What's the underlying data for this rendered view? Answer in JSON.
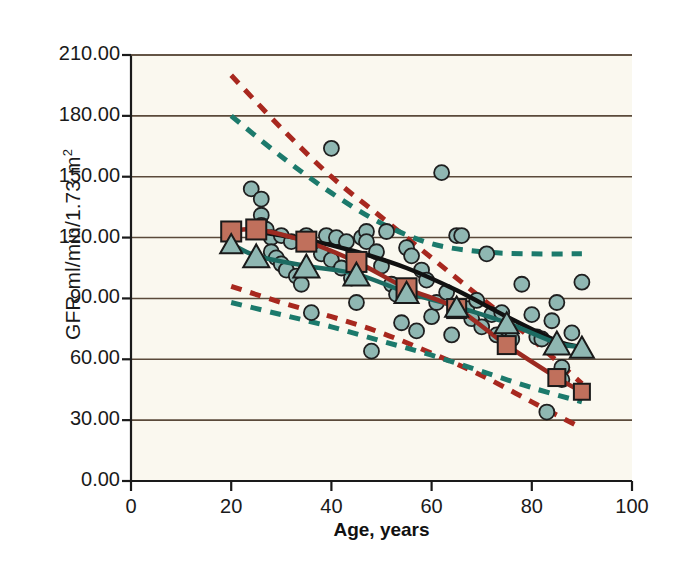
{
  "chart_data": {
    "type": "scatter",
    "title": "",
    "xlabel": "Age, years",
    "ylabel_text": "GFR ml/min/1.73 m",
    "ylabel_sup": "2",
    "xlim": [
      0,
      100
    ],
    "ylim": [
      0,
      210
    ],
    "grid": "horizontal",
    "xticks": [
      0,
      20,
      40,
      60,
      80,
      100
    ],
    "xtick_labels": [
      "0",
      "20",
      "40",
      "60",
      "80",
      "100"
    ],
    "yticks": [
      0,
      30,
      60,
      90,
      120,
      150,
      180,
      210
    ],
    "ytick_labels": [
      "0.00",
      "30.00",
      "60.00",
      "90.00",
      "120.00",
      "150.00",
      "180.00",
      "210.00"
    ],
    "legend": "none",
    "colors": {
      "plot_background": "#faf8ef",
      "grid": "#5a4a3a",
      "axis": "#1a1a1a",
      "scatter_fill": "#8fb7b2",
      "scatter_edge": "#1f1f1f",
      "square_fill": "#c0705c",
      "square_edge": "#1a1a1a",
      "triangle_fill": "#8fb7b2",
      "triangle_edge": "#1a1a1a",
      "black_curve": "#111111",
      "red_line": "#9c2a21",
      "teal_line": "#1c6b62",
      "red_dashed": "#a8281f",
      "teal_dashed": "#1c7a6c"
    },
    "series": [
      {
        "name": "Individual measurements",
        "marker": "circle",
        "color": "#8fb7b2",
        "points": [
          [
            24,
            144
          ],
          [
            26,
            139
          ],
          [
            26,
            131
          ],
          [
            26,
            126
          ],
          [
            27,
            124
          ],
          [
            28,
            120
          ],
          [
            28,
            113
          ],
          [
            29,
            110
          ],
          [
            30,
            121
          ],
          [
            30,
            107
          ],
          [
            31,
            104
          ],
          [
            32,
            118
          ],
          [
            33,
            101
          ],
          [
            34,
            97
          ],
          [
            35,
            121
          ],
          [
            36,
            83
          ],
          [
            38,
            112
          ],
          [
            39,
            121
          ],
          [
            40,
            164
          ],
          [
            40,
            109
          ],
          [
            41,
            120
          ],
          [
            42,
            105
          ],
          [
            43,
            118
          ],
          [
            44,
            100
          ],
          [
            45,
            88
          ],
          [
            46,
            120
          ],
          [
            47,
            123
          ],
          [
            47,
            118
          ],
          [
            48,
            64
          ],
          [
            49,
            113
          ],
          [
            50,
            106
          ],
          [
            51,
            123
          ],
          [
            52,
            97
          ],
          [
            53,
            92
          ],
          [
            54,
            78
          ],
          [
            55,
            115
          ],
          [
            56,
            111
          ],
          [
            57,
            74
          ],
          [
            58,
            104
          ],
          [
            59,
            99
          ],
          [
            60,
            81
          ],
          [
            61,
            88
          ],
          [
            62,
            152
          ],
          [
            63,
            93
          ],
          [
            64,
            72
          ],
          [
            65,
            121
          ],
          [
            66,
            121
          ],
          [
            67,
            85
          ],
          [
            68,
            80
          ],
          [
            69,
            89
          ],
          [
            70,
            76
          ],
          [
            71,
            112
          ],
          [
            72,
            82
          ],
          [
            73,
            72
          ],
          [
            74,
            83
          ],
          [
            75,
            75
          ],
          [
            76,
            70
          ],
          [
            78,
            97
          ],
          [
            80,
            82
          ],
          [
            81,
            71
          ],
          [
            82,
            70
          ],
          [
            83,
            34
          ],
          [
            84,
            79
          ],
          [
            85,
            88
          ],
          [
            86,
            56
          ],
          [
            86,
            50
          ],
          [
            88,
            73
          ],
          [
            90,
            98
          ]
        ]
      },
      {
        "name": "Mean GFR (squares)",
        "marker": "square",
        "color": "#c0705c",
        "line": "solid",
        "line_color": "#9c2a21",
        "x": [
          20,
          25,
          35,
          45,
          55,
          65,
          75,
          85,
          90
        ],
        "y": [
          123,
          124,
          118,
          108,
          95,
          85,
          67,
          51,
          44
        ]
      },
      {
        "name": "Mean GFR (triangles)",
        "marker": "triangle",
        "color": "#8fb7b2",
        "line": "solid",
        "line_color": "#1c6b62",
        "x": [
          20,
          25,
          35,
          45,
          55,
          65,
          75,
          85,
          90
        ],
        "y": [
          117,
          111,
          106,
          102,
          93,
          86,
          78,
          68,
          66
        ]
      },
      {
        "name": "Fitted regression (black)",
        "marker": "none",
        "line": "solid",
        "line_color": "#111111",
        "x": [
          25,
          35,
          45,
          55,
          65,
          75,
          85,
          90
        ],
        "y": [
          123,
          119,
          113,
          105,
          94,
          81,
          69,
          66
        ]
      },
      {
        "name": "95% prediction interval upper (red dashed)",
        "marker": "none",
        "line": "dashed",
        "line_color": "#a8281f",
        "x": [
          20,
          30,
          40,
          50,
          60,
          70,
          80,
          90
        ],
        "y": [
          200,
          174,
          150,
          130,
          110,
          90,
          70,
          48
        ]
      },
      {
        "name": "95% prediction interval lower (red dashed)",
        "marker": "none",
        "line": "dashed",
        "line_color": "#a8281f",
        "x": [
          20,
          30,
          40,
          50,
          60,
          70,
          80,
          90
        ],
        "y": [
          96,
          88,
          81,
          73,
          63,
          52,
          39,
          26
        ]
      },
      {
        "name": "95% prediction interval upper (teal dashed)",
        "marker": "none",
        "line": "dashed",
        "line_color": "#1c7a6c",
        "x": [
          20,
          30,
          40,
          50,
          60,
          70,
          80,
          90
        ],
        "y": [
          180,
          160,
          142,
          127,
          117,
          113,
          112,
          112
        ]
      },
      {
        "name": "95% prediction interval lower (teal dashed)",
        "marker": "none",
        "line": "dashed",
        "line_color": "#1c7a6c",
        "x": [
          20,
          30,
          40,
          50,
          60,
          70,
          80,
          90
        ],
        "y": [
          88,
          82,
          76,
          69,
          62,
          54,
          46,
          39
        ]
      }
    ]
  }
}
